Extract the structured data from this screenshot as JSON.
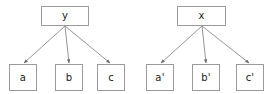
{
  "canvas": {
    "width": 272,
    "height": 94,
    "background": "#ffffff"
  },
  "style": {
    "box_border_color": "#9a9a9a",
    "box_fill_color": "#ffffff",
    "edge_color": "#8a8a8a",
    "text_color": "#1a1a1a"
  },
  "diagrams": [
    {
      "id": "left-tree",
      "name": "tree-y",
      "root": {
        "id": "node-y",
        "label": "y",
        "x": 41,
        "y": 6,
        "width": 48,
        "height": 20
      },
      "children": [
        {
          "id": "node-a",
          "label": "a",
          "x": 9,
          "y": 64,
          "width": 28,
          "height": 27
        },
        {
          "id": "node-b",
          "label": "b",
          "x": 55,
          "y": 64,
          "width": 28,
          "height": 27
        },
        {
          "id": "node-c",
          "label": "c",
          "x": 97,
          "y": 64,
          "width": 28,
          "height": 27
        }
      ],
      "edges": [
        {
          "from": "node-y",
          "to": "node-a",
          "x1": 65,
          "y1": 26,
          "x2": 24,
          "y2": 63
        },
        {
          "from": "node-y",
          "to": "node-b",
          "x1": 65,
          "y1": 26,
          "x2": 69,
          "y2": 63
        },
        {
          "from": "node-y",
          "to": "node-c",
          "x1": 65,
          "y1": 26,
          "x2": 110,
          "y2": 63
        }
      ]
    },
    {
      "id": "right-tree",
      "name": "tree-x",
      "root": {
        "id": "node-x",
        "label": "x",
        "x": 177,
        "y": 6,
        "width": 49,
        "height": 20
      },
      "children": [
        {
          "id": "node-a-prime",
          "label": "a'",
          "x": 146,
          "y": 64,
          "width": 28,
          "height": 27
        },
        {
          "id": "node-b-prime",
          "label": "b'",
          "x": 192,
          "y": 64,
          "width": 28,
          "height": 27
        },
        {
          "id": "node-c-prime",
          "label": "c'",
          "x": 236,
          "y": 64,
          "width": 28,
          "height": 27
        }
      ],
      "edges": [
        {
          "from": "node-x",
          "to": "node-a-prime",
          "x1": 202,
          "y1": 26,
          "x2": 161,
          "y2": 63
        },
        {
          "from": "node-x",
          "to": "node-b-prime",
          "x1": 202,
          "y1": 26,
          "x2": 206,
          "y2": 63
        },
        {
          "from": "node-x",
          "to": "node-c-prime",
          "x1": 202,
          "y1": 26,
          "x2": 249,
          "y2": 63
        }
      ]
    }
  ]
}
